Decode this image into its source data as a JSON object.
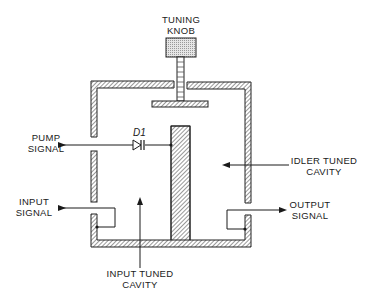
{
  "diagram": {
    "labels": {
      "tuning_knob_line1": "TUNING",
      "tuning_knob_line2": "KNOB",
      "pump_signal_line1": "PUMP",
      "pump_signal_line2": "SIGNAL",
      "diode": "D1",
      "idler_line1": "IDLER TUNED",
      "idler_line2": "CAVITY",
      "input_signal_line1": "INPUT",
      "input_signal_line2": "SIGNAL",
      "output_signal_line1": "OUTPUT",
      "output_signal_line2": "SIGNAL",
      "input_cavity_line1": "INPUT TUNED",
      "input_cavity_line2": "CAVITY"
    },
    "components": [
      {
        "id": "tuning-knob",
        "type": "knob"
      },
      {
        "id": "tuning-shaft",
        "type": "shaft"
      },
      {
        "id": "tuning-plate",
        "type": "plate"
      },
      {
        "id": "outer-cavity-wall",
        "type": "hatched-wall"
      },
      {
        "id": "center-post",
        "type": "hatched-post"
      },
      {
        "id": "diode-d1",
        "type": "varactor-diode"
      },
      {
        "id": "input-coupling-loop",
        "type": "loop"
      },
      {
        "id": "output-coupling-loop",
        "type": "loop"
      }
    ],
    "colors": {
      "ink": "#1a1a1a",
      "hatch": "#333333",
      "knob_fill": "#d9d9d9",
      "background": "#ffffff"
    }
  }
}
